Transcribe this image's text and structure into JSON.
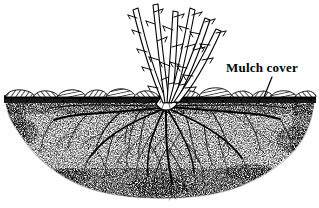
{
  "figure": {
    "type": "line-art-illustration",
    "background_color": "#ffffff",
    "ink_color": "#000000",
    "width": 319,
    "height": 208
  },
  "annotations": [
    {
      "id": "mulch-cover",
      "label": "Mulch cover",
      "text_x": 226,
      "text_y": 72,
      "font_size": 13,
      "bold": true,
      "leader_line": {
        "x1": 272,
        "y1": 76,
        "x2": 264,
        "y2": 98
      }
    }
  ],
  "scene": {
    "ground_line_y": 102,
    "mulch_layer": {
      "name": "mulch cover",
      "y_top": 88,
      "y_bottom": 103,
      "x_start": 4,
      "x_end": 316,
      "chunk_count": 18,
      "hatch_angle_deg": 35
    },
    "soil_mound": {
      "name": "soil",
      "texture": "stipple",
      "y_top": 103,
      "y_bottom": 198,
      "x_left": 6,
      "x_right": 314,
      "shape": "bowl"
    },
    "crown": {
      "x": 166,
      "y": 106
    },
    "canes": {
      "name": "canes",
      "count": 6,
      "thorns_per_cane": 5,
      "tops": [
        {
          "x": 131,
          "y": 7
        },
        {
          "x": 152,
          "y": 3
        },
        {
          "x": 172,
          "y": 10
        },
        {
          "x": 190,
          "y": 6
        },
        {
          "x": 206,
          "y": 16
        },
        {
          "x": 218,
          "y": 27
        }
      ]
    },
    "roots": {
      "name": "root system",
      "main_root_count": 11,
      "spread_x_left": 52,
      "spread_x_right": 288,
      "depth_y": 190
    }
  }
}
